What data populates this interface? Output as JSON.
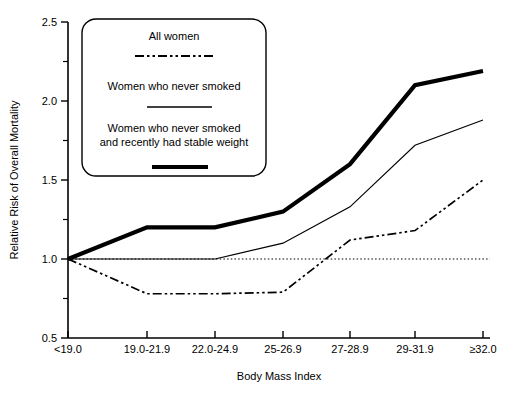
{
  "chart_data": {
    "type": "line",
    "title": "",
    "xlabel": "Body Mass Index",
    "ylabel": "Relative Risk of Overall Mortality",
    "categories": [
      "<19.0",
      "19.0-21.9",
      "22.0-24.9",
      "25-26.9",
      "27-28.9",
      "29-31.9",
      "≥32.0"
    ],
    "ylim": [
      0.5,
      2.5
    ],
    "ytick_labels": [
      "0.5",
      "1.0",
      "1.5",
      "2.0",
      "2.5"
    ],
    "ytick_values": [
      0.5,
      1.0,
      1.5,
      2.0,
      2.5
    ],
    "yminor_values": [
      0.75,
      1.25,
      1.75,
      2.25
    ],
    "grid": false,
    "legend_position": "upper-left-inset",
    "reference_line": {
      "value": 1.0,
      "style": "dotted",
      "label": ""
    },
    "series": [
      {
        "name": "All women",
        "style": "dash-dot",
        "values": [
          1.0,
          0.78,
          0.78,
          0.79,
          1.12,
          1.18,
          1.5
        ]
      },
      {
        "name": "Women who never smoked",
        "style": "thin-solid",
        "values": [
          1.0,
          1.0,
          1.0,
          1.1,
          1.33,
          1.72,
          1.88
        ]
      },
      {
        "name": "Women who never smoked and recently had stable weight",
        "style": "thick-solid",
        "values": [
          1.0,
          1.2,
          1.2,
          1.3,
          1.6,
          2.1,
          2.19
        ]
      }
    ]
  },
  "legend": {
    "entries": [
      {
        "label": "All women",
        "swatch": "dash-dot-line-swatch"
      },
      {
        "label": "Women who never smoked",
        "swatch": "thin-line-swatch"
      },
      {
        "label_line1": "Women who never smoked",
        "label_line2": "and recently had stable weight",
        "swatch": "thick-line-swatch"
      }
    ]
  },
  "axes": {
    "y_title": "Relative Risk of Overall Mortality",
    "x_title": "Body Mass Index",
    "y_ticks": [
      "2.5",
      "2.0",
      "1.5",
      "1.0",
      "0.5"
    ],
    "x_ticks": [
      "<19.0",
      "19.0-21.9",
      "22.0-24.9",
      "25-26.9",
      "27-28.9",
      "29-31.9",
      "≥32.0"
    ]
  },
  "colors": {
    "line": "#000000",
    "background": "#ffffff",
    "axis": "#000000"
  }
}
